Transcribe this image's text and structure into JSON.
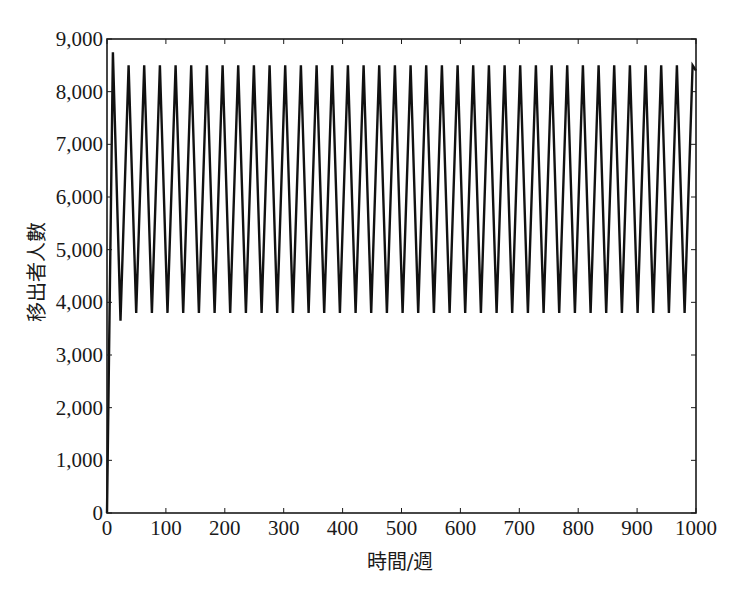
{
  "chart_data": {
    "type": "line",
    "title": "",
    "xlabel": "時間/週",
    "ylabel": "移出者人數",
    "xlim": [
      0,
      1000
    ],
    "ylim": [
      0,
      9000
    ],
    "x_ticks": [
      0,
      100,
      200,
      300,
      400,
      500,
      600,
      700,
      800,
      900,
      1000
    ],
    "x_tick_labels": [
      "0",
      "100",
      "200",
      "300",
      "400",
      "500",
      "600",
      "700",
      "800",
      "900",
      "1000"
    ],
    "y_ticks": [
      0,
      1000,
      2000,
      3000,
      4000,
      5000,
      6000,
      7000,
      8000,
      9000
    ],
    "y_tick_labels": [
      "0",
      "1,000",
      "2,000",
      "3,000",
      "4,000",
      "5,000",
      "6,000",
      "7,000",
      "8,000",
      "9,000"
    ],
    "grid": false,
    "legend": null,
    "series": [
      {
        "name": "移出者人數",
        "color": "#111111",
        "description": "Sustained sawtooth oscillation after initial rise from 0",
        "initial": {
          "x": 0,
          "y": 0
        },
        "first_peak": {
          "x": 10,
          "y": 8750
        },
        "first_trough": {
          "x": 23,
          "y": 3650
        },
        "period_weeks": 26.6,
        "steady_peak": 8500,
        "steady_trough": 3800,
        "last_point": {
          "x": 1000,
          "y": 8400
        }
      }
    ]
  },
  "colors": {
    "line": "#111111",
    "axis": "#1a1a1a",
    "background": "#ffffff"
  }
}
